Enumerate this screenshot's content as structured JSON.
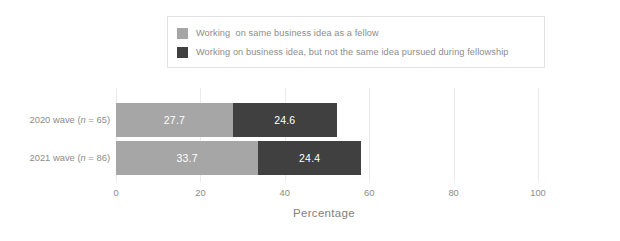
{
  "chart_data": {
    "type": "bar",
    "orientation": "horizontal",
    "stacked": true,
    "title": "",
    "subtitle": "",
    "xlabel": "Percentage",
    "ylabel": "",
    "xlim": [
      0,
      100
    ],
    "xticks": [
      0,
      20,
      40,
      60,
      80,
      100
    ],
    "xtick_labels": [
      "0",
      "20",
      "40",
      "60",
      "80",
      "100"
    ],
    "grid": "vertical",
    "legend_position": "top-center",
    "categories": [
      "2020 wave (n = 65)",
      "2021 wave (n = 86)"
    ],
    "category_parts": [
      {
        "prefix": "2020 wave (",
        "italic": "n",
        "suffix": " = 65)"
      },
      {
        "prefix": "2021 wave (",
        "italic": "n",
        "suffix": " = 86)"
      }
    ],
    "series": [
      {
        "name": "Working  on same business idea as a fellow",
        "color": "#a6a6a6",
        "values": [
          27.7,
          33.7
        ],
        "value_labels": [
          "27.7",
          "33.7"
        ]
      },
      {
        "name": "Working on business idea, but not the same idea pursued during fellowship",
        "color": "#404040",
        "values": [
          24.6,
          24.4
        ],
        "value_labels": [
          "24.6",
          "24.4"
        ]
      }
    ],
    "totals": [
      52.3,
      58.1
    ]
  },
  "legend": {
    "entries": [
      {
        "label": "Working  on same business idea as a fellow",
        "color": "#a6a6a6"
      },
      {
        "label": "Working on business idea, but not the same idea pursued during fellowship",
        "color": "#404040"
      }
    ]
  },
  "axes": {
    "x_title": "Percentage",
    "x_tick_labels": [
      "0",
      "20",
      "40",
      "60",
      "80",
      "100"
    ],
    "y_tick_labels": [
      "2020 wave (n = 65)",
      "2021 wave (n = 86)"
    ]
  },
  "colors": {
    "series_light": "#a6a6a6",
    "series_dark": "#404040",
    "text": "#8c8c8c",
    "grid": "#ebebeb",
    "background": "#ffffff",
    "legend_border": "#e2e2e2",
    "value_label": "#ffffff"
  }
}
